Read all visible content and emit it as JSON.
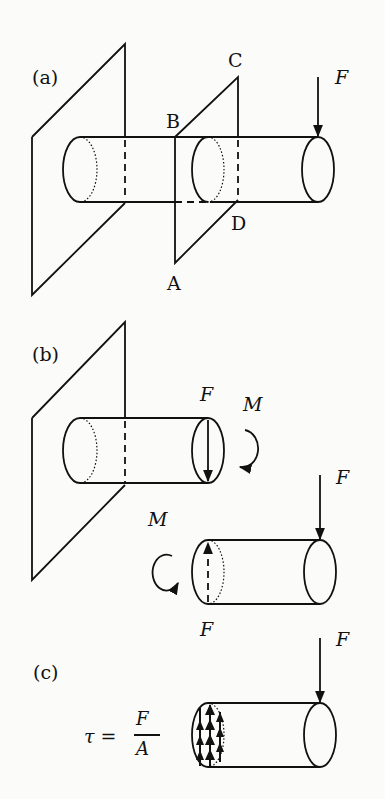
{
  "panels": {
    "a": {
      "label": "(a)",
      "points": {
        "A": "A",
        "B": "B",
        "C": "C",
        "D": "D"
      },
      "force": "F"
    },
    "b": {
      "label": "(b)",
      "force_top": "F",
      "moment_top": "M",
      "force_right": "F",
      "moment_bottom": "M",
      "force_bottom": "F"
    },
    "c": {
      "label": "(c)",
      "force": "F",
      "formula": {
        "lhs": "τ =",
        "numerator": "F",
        "denominator": "A"
      }
    }
  },
  "colors": {
    "stroke": "#111111",
    "background": "#fbfbf9"
  }
}
